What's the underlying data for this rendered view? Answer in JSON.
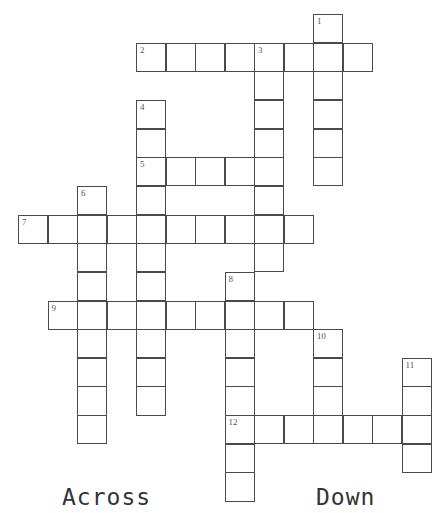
{
  "puzzle": {
    "grid": {
      "origin_x": 18,
      "origin_y": 14,
      "cell_w": 29.5,
      "cell_h": 28.65
    },
    "words": [
      {
        "number": "1",
        "direction": "down",
        "row": 0,
        "col": 10,
        "length": 6
      },
      {
        "number": "2",
        "direction": "across",
        "row": 1,
        "col": 4,
        "length": 8
      },
      {
        "number": "3",
        "direction": "down",
        "row": 1,
        "col": 8,
        "length": 8
      },
      {
        "number": "4",
        "direction": "down",
        "row": 3,
        "col": 4,
        "length": 11
      },
      {
        "number": "5",
        "direction": "across",
        "row": 5,
        "col": 4,
        "length": 5
      },
      {
        "number": "6",
        "direction": "down",
        "row": 6,
        "col": 2,
        "length": 9
      },
      {
        "number": "7",
        "direction": "across",
        "row": 7,
        "col": 0,
        "length": 10
      },
      {
        "number": "8",
        "direction": "down",
        "row": 9,
        "col": 7,
        "length": 8
      },
      {
        "number": "9",
        "direction": "across",
        "row": 10,
        "col": 1,
        "length": 9
      },
      {
        "number": "10",
        "direction": "down",
        "row": 11,
        "col": 10,
        "length": 4
      },
      {
        "number": "11",
        "direction": "down",
        "row": 12,
        "col": 13,
        "length": 4
      },
      {
        "number": "12",
        "direction": "across",
        "row": 14,
        "col": 7,
        "length": 7
      }
    ]
  },
  "headings": {
    "across": "Across",
    "down": "Down"
  }
}
